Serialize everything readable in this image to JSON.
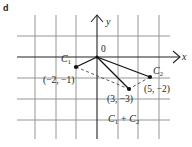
{
  "panel_label": "d",
  "axes": {
    "x_label": "x",
    "y_label": "y",
    "origin_label": "0"
  },
  "grid": {
    "units_per_cell": 2,
    "x_cells": [
      -3,
      3
    ],
    "y_cells": [
      -3,
      1
    ]
  },
  "vectors": [
    {
      "name": "C1",
      "label_main": "C",
      "label_sub": "1",
      "point": [
        -2,
        -1
      ],
      "coord_label": "(−2, −1)"
    },
    {
      "name": "C2",
      "label_main": "C",
      "label_sub": "2",
      "point": [
        5,
        -2
      ],
      "coord_label": "(5, −2)"
    },
    {
      "name": "C1+C2",
      "label_parts": [
        "C",
        "1",
        " + C",
        "2"
      ],
      "point": [
        3,
        -3
      ],
      "coord_label": "(3, −3)"
    }
  ],
  "sum_label": {
    "c1": "C",
    "s1": "1",
    "plus": "+",
    "c2": "C",
    "s2": "2"
  },
  "colors": {
    "grid": "#8a8a8a",
    "axis": "#222222",
    "vector": "#111111",
    "dashed": "#444444"
  }
}
